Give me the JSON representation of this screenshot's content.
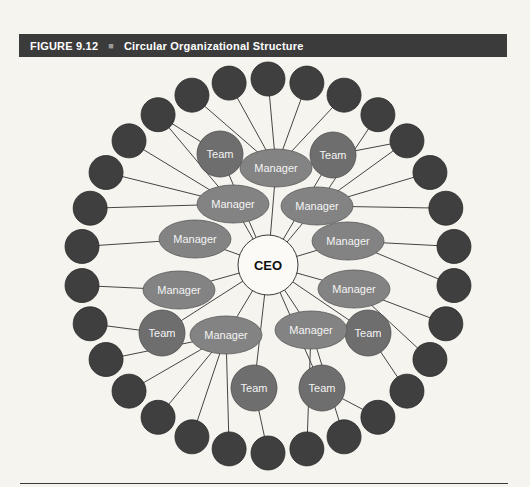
{
  "header": {
    "figure_label": "FIGURE 9.12",
    "separator": "■",
    "title": "Circular Organizational Structure"
  },
  "colors": {
    "page_bg": "#f6f4ef",
    "header_bg": "#3b3b3b",
    "header_text": "#ffffff",
    "line": "#454545",
    "node_stroke": "#2a2a2a",
    "outer_fill": "#3f3f3f",
    "manager_fill": "#838383",
    "manager_stroke": "#5a5a5a",
    "team_fill": "#6e6e6e",
    "team_stroke": "#4d4d4d",
    "ceo_fill": "#fbfaf6",
    "ceo_stroke": "#3a3a3a",
    "node_label": "#f4f4f4",
    "ceo_label": "#101010"
  },
  "diagram": {
    "center": {
      "id": "ceo",
      "label": "CEO",
      "x": 268,
      "y": 265,
      "r": 30,
      "font_size": 13
    },
    "manager_rx": 36,
    "manager_ry": 19,
    "manager_font_size": 11,
    "managers": [
      {
        "id": "m1",
        "label": "Manager",
        "x": 276,
        "y": 168
      },
      {
        "id": "m2",
        "label": "Manager",
        "x": 233,
        "y": 204
      },
      {
        "id": "m3",
        "label": "Manager",
        "x": 317,
        "y": 206
      },
      {
        "id": "m4",
        "label": "Manager",
        "x": 195,
        "y": 239
      },
      {
        "id": "m5",
        "label": "Manager",
        "x": 348,
        "y": 241
      },
      {
        "id": "m6",
        "label": "Manager",
        "x": 179,
        "y": 290
      },
      {
        "id": "m7",
        "label": "Manager",
        "x": 354,
        "y": 289
      },
      {
        "id": "m8",
        "label": "Manager",
        "x": 226,
        "y": 335
      },
      {
        "id": "m9",
        "label": "Manager",
        "x": 311,
        "y": 330
      }
    ],
    "team_r": 23,
    "team_font_size": 11,
    "teams": [
      {
        "id": "t1",
        "label": "Team",
        "x": 220,
        "y": 154
      },
      {
        "id": "t2",
        "label": "Team",
        "x": 333,
        "y": 155
      },
      {
        "id": "t3",
        "label": "Team",
        "x": 162,
        "y": 333
      },
      {
        "id": "t4",
        "label": "Team",
        "x": 368,
        "y": 333
      },
      {
        "id": "t5",
        "label": "Team",
        "x": 254,
        "y": 388
      },
      {
        "id": "t6",
        "label": "Team",
        "x": 322,
        "y": 388
      }
    ],
    "outer_ring": {
      "count": 30,
      "cx": 268,
      "cy": 266,
      "ring_r": 187,
      "node_r": 17,
      "start_angle_deg": 90,
      "step_deg": -12
    },
    "links": {
      "from_center": [
        "m1",
        "m2",
        "m3",
        "m4",
        "m5",
        "m6",
        "m7",
        "m8",
        "m9",
        "t1",
        "t2",
        "t3",
        "t4",
        "t5",
        "t6"
      ],
      "spokes": [
        [
          "m1",
          28
        ],
        [
          "m1",
          29
        ],
        [
          "m1",
          0
        ],
        [
          "m1",
          1
        ],
        [
          "m1",
          2
        ],
        [
          "m2",
          27
        ],
        [
          "m2",
          26
        ],
        [
          "m2",
          25
        ],
        [
          "m2",
          24
        ],
        [
          "m3",
          3
        ],
        [
          "m3",
          4
        ],
        [
          "m3",
          5
        ],
        [
          "m3",
          6
        ],
        [
          "m4",
          23
        ],
        [
          "m5",
          7
        ],
        [
          "m5",
          8
        ],
        [
          "m6",
          22
        ],
        [
          "m7",
          9
        ],
        [
          "m7",
          10
        ],
        [
          "m8",
          16
        ],
        [
          "m8",
          17
        ],
        [
          "m8",
          18
        ],
        [
          "m8",
          19
        ],
        [
          "m8",
          20
        ],
        [
          "m9",
          13
        ],
        [
          "m9",
          14
        ],
        [
          "t1",
          27
        ],
        [
          "t2",
          4
        ],
        [
          "t3",
          21
        ],
        [
          "t4",
          11
        ],
        [
          "t5",
          15
        ],
        [
          "t6",
          12
        ]
      ]
    }
  }
}
